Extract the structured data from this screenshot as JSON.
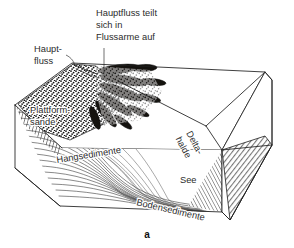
{
  "figure": {
    "caption": "a",
    "type": "block-diagram",
    "language": "de",
    "background_color": "#ffffff",
    "line_color": "#1d1d1d"
  },
  "labels": {
    "main_river": {
      "id": "haupt-fluss",
      "lines": [
        "Haupt-",
        "fluss"
      ],
      "x": 34,
      "y": 52,
      "rotation": 0,
      "has_leader": true
    },
    "distributaries": {
      "id": "hauptfluss-teilt-sich",
      "lines": [
        "Hauptfluss teilt",
        "sich in",
        "Flussarme auf"
      ],
      "x": 96,
      "y": 16,
      "rotation": 0,
      "has_leader": true
    },
    "platform_sands": {
      "id": "plattform-sande",
      "lines": [
        "Plattform-",
        "sande"
      ],
      "x": 30,
      "y": 113,
      "rotation": 0,
      "has_leader": false
    },
    "slope_sediments": {
      "id": "hangsedimente",
      "lines": [
        "Hangsedimente"
      ],
      "x": 57,
      "y": 163,
      "rotation": -9,
      "has_leader": false
    },
    "delta_slope": {
      "id": "delta-halde",
      "lines": [
        "Delta-",
        "halde"
      ],
      "x": 186,
      "y": 133,
      "rotation": 62,
      "has_leader": false
    },
    "lake": {
      "id": "see",
      "lines": [
        "See"
      ],
      "x": 180,
      "y": 183,
      "rotation": 0,
      "has_leader": false
    },
    "bottom_sediments": {
      "id": "bodensedimente",
      "lines": [
        "Bodensedimente"
      ],
      "x": 136,
      "y": 205,
      "rotation": 13,
      "has_leader": false
    }
  },
  "colors": {
    "ink": "#1d1d1d",
    "stipple": "#15130f",
    "shade": "#8a8a8a",
    "paper": "#ffffff"
  }
}
